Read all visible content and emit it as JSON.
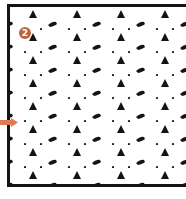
{
  "figure": {
    "badge_label": "2",
    "badge_color": "#c4603f",
    "arrow_color": "#e07a55",
    "border_color": "#141414",
    "pattern": {
      "motifs": [
        "triangle",
        "shoe",
        "dot"
      ],
      "motif_color": "#141414",
      "period_x": 44,
      "period_y": 23
    }
  }
}
